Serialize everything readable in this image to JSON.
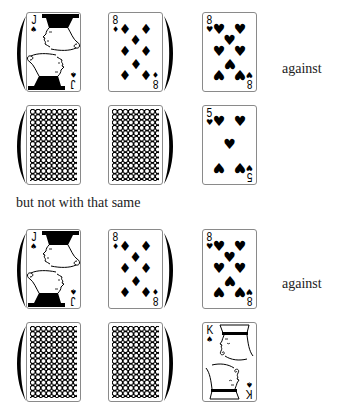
{
  "rows": [
    {
      "cards": [
        {
          "rank": "J",
          "suit": "spades",
          "suit_symbol": "♠",
          "face_up": true
        },
        {
          "rank": "8",
          "suit": "diamonds",
          "suit_symbol": "♦",
          "face_up": true
        },
        {
          "rank": "8",
          "suit": "hearts",
          "suit_symbol": "♥",
          "face_up": true
        }
      ],
      "label": "against"
    },
    {
      "cards": [
        {
          "face_up": false
        },
        {
          "face_up": false
        },
        {
          "rank": "5",
          "suit": "hearts",
          "suit_symbol": "♥",
          "face_up": true
        }
      ]
    },
    {
      "cards": [
        {
          "rank": "J",
          "suit": "spades",
          "suit_symbol": "♠",
          "face_up": true
        },
        {
          "rank": "8",
          "suit": "diamonds",
          "suit_symbol": "♦",
          "face_up": true
        },
        {
          "rank": "8",
          "suit": "hearts",
          "suit_symbol": "♥",
          "face_up": true
        }
      ],
      "label": "against"
    },
    {
      "cards": [
        {
          "face_up": false
        },
        {
          "face_up": false
        },
        {
          "rank": "K",
          "suit": "spades",
          "suit_symbol": "♠",
          "face_up": true
        }
      ]
    }
  ],
  "caption": "but not with that same",
  "icons": {
    "paren_left": "left-parenthesis-icon",
    "paren_right": "right-parenthesis-icon",
    "card_back": "card-back-pattern"
  }
}
